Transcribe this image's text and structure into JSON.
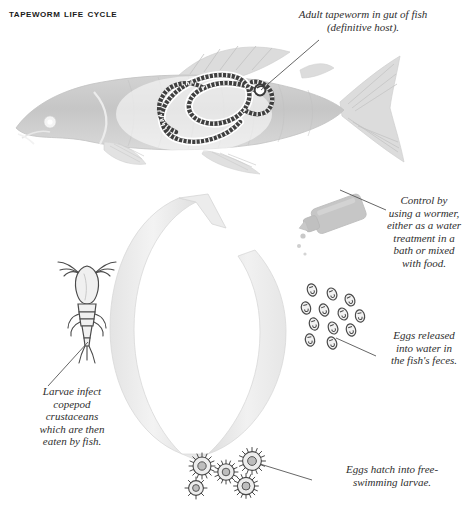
{
  "title": "Tapeworm life cycle",
  "colors": {
    "title_text": "#1a1a1a",
    "caption_text": "#2e2e2e",
    "fish_body": "#c9c9c9",
    "fish_fin": "#dcdcdc",
    "worm_outline": "#3a3a3a",
    "cycle_arrow": "#ededed",
    "cycle_arrow_edge": "#d8d8d8",
    "egg_outline": "#4a4a4a",
    "larva_outline": "#4a4a4a",
    "copepod_outline": "#4a4a4a",
    "bottle_fill": "#c4c4c4",
    "leader_line": "#555555",
    "page_background": "#ffffff"
  },
  "captions": {
    "adult_tapeworm": "Adult tapeworm in gut of fish\n(definitive host).",
    "control_wormer": "Control by\nusing a wormer,\neither as a water\ntreatment in a\nbath or mixed\nwith food.",
    "eggs_released": "Eggs released\ninto water in\nthe fish's feces.",
    "eggs_hatch": "Eggs hatch into free-\nswimming larvae.",
    "larvae_infect": "Larvae infect\ncopepod\ncrustaceans\nwhich are then\neaten by fish."
  },
  "illustrations": {
    "fish": "fish-with-tapeworm",
    "cycle_arrow": "circular-cycle-arrow",
    "bottle": "wormer-dropper-bottle",
    "eggs": "tapeworm-egg-cluster",
    "larvae": "free-swimming-larvae-cluster",
    "copepod": "copepod-crustacean"
  },
  "counts": {
    "eggs": 12,
    "larvae": 5
  }
}
